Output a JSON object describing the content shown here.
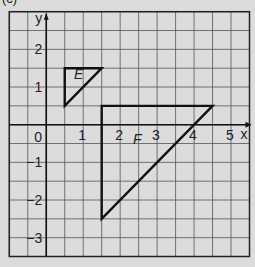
{
  "part_label": "(c)",
  "chart_data": {
    "type": "diagram",
    "title": "",
    "xlabel": "x",
    "ylabel": "y",
    "xlim": [
      -1,
      5.5
    ],
    "ylim": [
      -3.5,
      3
    ],
    "grid": true,
    "grid_step": 0.5,
    "x_ticks": [
      {
        "value": 0,
        "label": "0"
      },
      {
        "value": 1,
        "label": "1"
      },
      {
        "value": 2,
        "label": "2"
      },
      {
        "value": 3,
        "label": "3"
      },
      {
        "value": 4,
        "label": "4"
      },
      {
        "value": 5,
        "label": "5"
      }
    ],
    "y_ticks": [
      {
        "value": 2,
        "label": "2"
      },
      {
        "value": 1,
        "label": "1"
      },
      {
        "value": -1,
        "label": "−1"
      },
      {
        "value": -2,
        "label": "−2"
      },
      {
        "value": -3,
        "label": "−3"
      }
    ],
    "shapes": [
      {
        "name": "E",
        "vertices": [
          [
            0.5,
            0.5
          ],
          [
            0.5,
            1.5
          ],
          [
            1.5,
            1.5
          ]
        ],
        "label_pos": [
          0.75,
          1.2
        ]
      },
      {
        "name": "F",
        "vertices": [
          [
            1.5,
            0.5
          ],
          [
            4.5,
            0.5
          ],
          [
            1.5,
            -2.5
          ]
        ],
        "label_pos": [
          2.35,
          -0.5
        ]
      }
    ]
  }
}
